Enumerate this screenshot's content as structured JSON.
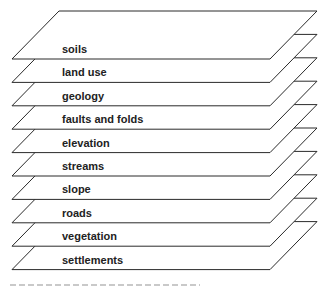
{
  "diagram": {
    "type": "stacked-layers",
    "layers": [
      {
        "label": "soils"
      },
      {
        "label": "land use"
      },
      {
        "label": "geology"
      },
      {
        "label": "faults and folds"
      },
      {
        "label": "elevation"
      },
      {
        "label": "streams"
      },
      {
        "label": "slope"
      },
      {
        "label": "roads"
      },
      {
        "label": "vegetation"
      },
      {
        "label": "settlements"
      }
    ],
    "colors": {
      "outline": "#2a2a2a",
      "fill": "#ffffff",
      "text": "#222222"
    },
    "caption_visible": "clipped"
  }
}
